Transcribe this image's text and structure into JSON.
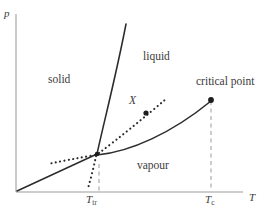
{
  "figure": {
    "background_color": "#ffffff",
    "line_color": "#2b2b2b",
    "axis_color": "#b9b9b9",
    "text_color": "#3a3a3a",
    "width": 272,
    "height": 210
  },
  "axes": {
    "y_label": "p",
    "x_label": "T",
    "origin": {
      "x": 16,
      "y": 192
    },
    "x_end": {
      "x": 243,
      "y": 192
    },
    "y_top": {
      "x": 16,
      "y": 14
    }
  },
  "regions": [
    {
      "name": "solid",
      "label": "solid",
      "x": 48,
      "y": 80
    },
    {
      "name": "liquid",
      "label": "liquid",
      "x": 143,
      "y": 57
    },
    {
      "name": "vapour",
      "label": "vapour",
      "x": 137,
      "y": 166
    }
  ],
  "points": [
    {
      "name": "critical-point",
      "label": "critical point",
      "label_x": 207,
      "label_y": 82,
      "dot_x": 211,
      "dot_y": 100,
      "tick_label": "T",
      "tick_sub": "c",
      "tick_x": 205,
      "tick_y": 194
    },
    {
      "name": "triple-point",
      "label": "",
      "dot_x": 97,
      "dot_y": 154,
      "tick_label": "T",
      "tick_sub": "tr",
      "tick_x": 86,
      "tick_y": 194
    },
    {
      "name": "state-x",
      "label": "X",
      "label_x": 131,
      "label_y": 101,
      "dot_x": 146,
      "dot_y": 113
    }
  ],
  "curves": [
    {
      "name": "sublimation-curve",
      "style": "solid",
      "description": "solid-vapour coexistence line from origin to triple point"
    },
    {
      "name": "fusion-curve",
      "style": "solid",
      "description": "solid-liquid coexistence line rising steeply from triple point"
    },
    {
      "name": "vaporisation-curve",
      "style": "solid",
      "description": "liquid-vapour coexistence line from triple point to critical point"
    },
    {
      "name": "metastable-extension-upper",
      "style": "dotted",
      "description": "dotted extension of vaporisation curve through X into liquid region"
    },
    {
      "name": "metastable-extension-left",
      "style": "dotted",
      "description": "dotted extension of vaporisation curve to the left of the triple point"
    },
    {
      "name": "metastable-extension-lower",
      "style": "dotted",
      "description": "dotted extension of fusion curve downward below the triple point"
    },
    {
      "name": "critical-temperature-guide",
      "style": "dashed",
      "description": "vertical dashed guide from critical point to the temperature axis"
    }
  ]
}
